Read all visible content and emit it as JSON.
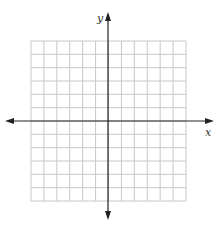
{
  "diagram": {
    "type": "coordinate-plane",
    "grid": {
      "columns": 12,
      "rows": 12,
      "left": 31,
      "top": 41,
      "right": 186,
      "bottom": 201,
      "line_color": "#c8c8c8"
    },
    "axes": {
      "color": "#222222",
      "x_axis": {
        "label": "x",
        "y_position": 121,
        "start_x": 5,
        "end_x": 214,
        "arrows": "both"
      },
      "y_axis": {
        "label": "y",
        "x_position": 108,
        "start_y": 12,
        "end_y": 220,
        "arrows": "both"
      }
    },
    "labels": {
      "x_label": "x",
      "y_label": "y"
    }
  }
}
